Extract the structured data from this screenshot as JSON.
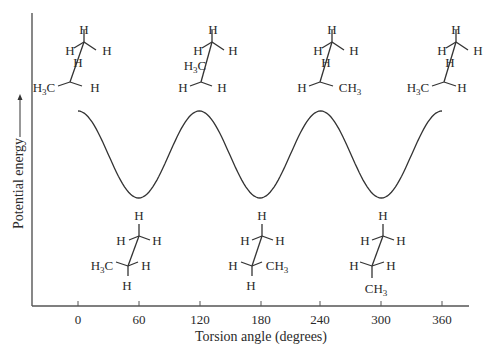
{
  "chart_data": {
    "type": "line",
    "title": "",
    "xlabel": "Torsion angle (degrees)",
    "ylabel": "Potential energy",
    "x_ticks": [
      0,
      60,
      120,
      180,
      240,
      300,
      360
    ],
    "x_tick_labels": [
      "0",
      "60",
      "120",
      "180",
      "240",
      "300",
      "360"
    ],
    "xlim": [
      0,
      360
    ],
    "grid": false,
    "legend": null,
    "series": [
      {
        "name": "Potential energy vs torsion angle (butane C2–C3)",
        "x": [
          0,
          60,
          120,
          180,
          240,
          300,
          360
        ],
        "y_relative": [
          "max",
          "min",
          "max",
          "min",
          "max",
          "min",
          "max"
        ],
        "shape": "cosine, period 120 degrees, equal maxima and equal minima"
      }
    ],
    "annotations": {
      "top_structures": [
        {
          "angle": 0,
          "front_carbon": {
            "top": "H",
            "left": "H",
            "right": "H",
            "hidden": "H"
          },
          "back_carbon": {
            "left": "H3C",
            "right": "H"
          }
        },
        {
          "angle": 120,
          "front_carbon": {
            "top": "H",
            "left": "H",
            "right": "H",
            "hidden": "H3C"
          },
          "back_carbon": {
            "left": "H",
            "right": "H"
          }
        },
        {
          "angle": 240,
          "front_carbon": {
            "top": "H",
            "left": "H",
            "right": "H",
            "hidden": "H"
          },
          "back_carbon": {
            "left": "H",
            "right": "CH3"
          }
        },
        {
          "angle": 360,
          "front_carbon": {
            "top": "H",
            "left": "H",
            "right": "H",
            "hidden": "H"
          },
          "back_carbon": {
            "left": "H3C",
            "right": "H"
          }
        }
      ],
      "bottom_structures": [
        {
          "angle": 60,
          "front_carbon": {
            "top": "H",
            "left": "H",
            "right": "H"
          },
          "back_carbon": {
            "left": "H3C",
            "right": "H",
            "bottom": "H"
          }
        },
        {
          "angle": 180,
          "front_carbon": {
            "top": "H",
            "left": "H",
            "right": "H"
          },
          "back_carbon": {
            "left": "H",
            "right": "CH3",
            "bottom": "H"
          }
        },
        {
          "angle": 300,
          "front_carbon": {
            "top": "H",
            "left": "H",
            "right": "H"
          },
          "back_carbon": {
            "left": "H",
            "right": "H",
            "bottom": "CH3"
          }
        }
      ]
    }
  },
  "labels": {
    "xlabel": "Torsion angle (degrees)",
    "ylabel": "Potential energy",
    "ticks": [
      "0",
      "60",
      "120",
      "180",
      "240",
      "300",
      "360"
    ],
    "H": "H",
    "C": "C",
    "CH": "CH",
    "three": "3"
  }
}
